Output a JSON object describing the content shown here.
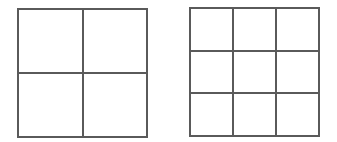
{
  "diagram": {
    "line_color": "#5a5a5a",
    "background": "#ffffff",
    "grids": [
      {
        "name": "grid-2x2",
        "rows": 2,
        "cols": 2,
        "box": {
          "left": 17,
          "top": 8,
          "width": 131,
          "height": 130
        }
      },
      {
        "name": "grid-3x3",
        "rows": 3,
        "cols": 3,
        "box": {
          "left": 189,
          "top": 7,
          "width": 131,
          "height": 130
        }
      }
    ]
  }
}
